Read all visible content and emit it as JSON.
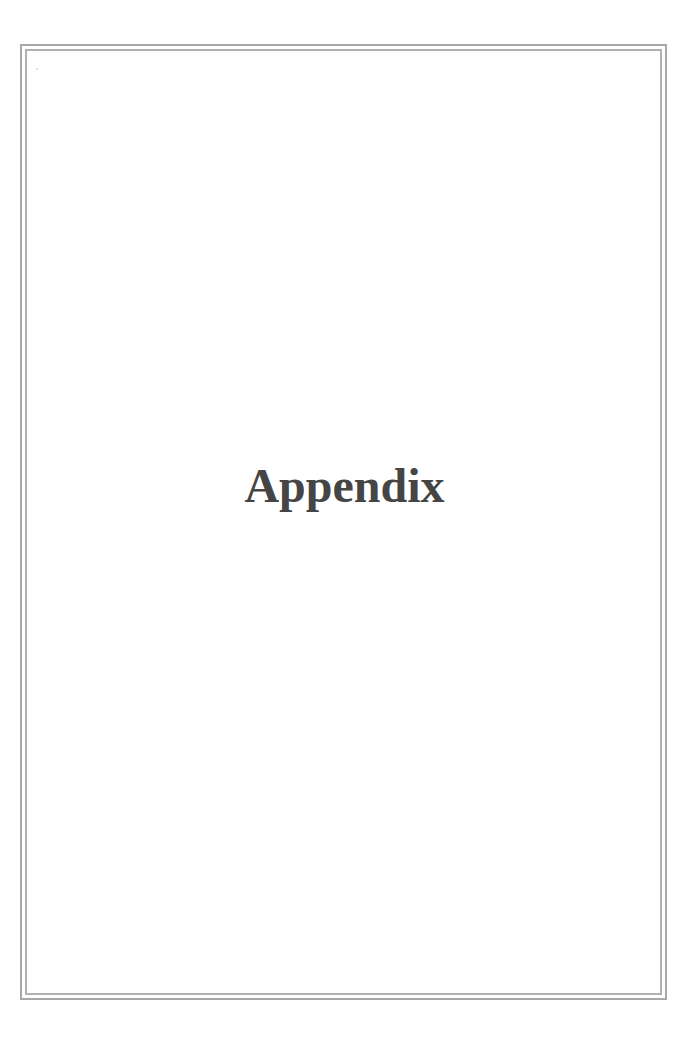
{
  "page": {
    "title": "Appendix",
    "colors": {
      "background": "#ffffff",
      "border": "#a8a8a8",
      "title_text": "#454545"
    }
  }
}
